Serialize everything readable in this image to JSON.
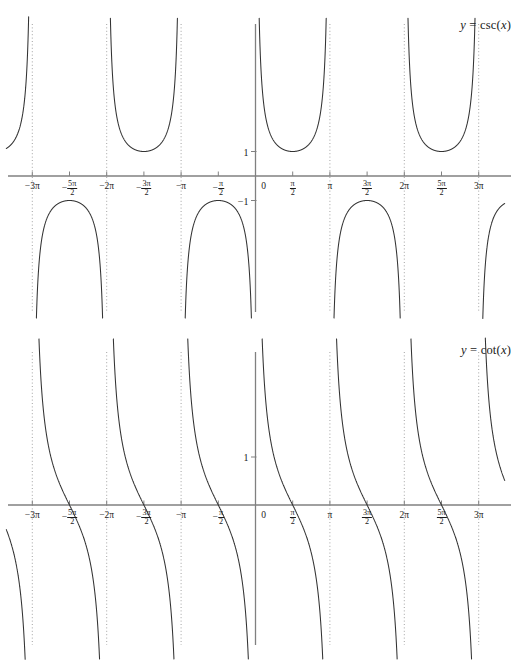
{
  "figure": {
    "panels": [
      {
        "id": "csc",
        "title_prefix": "y",
        "title_eq": " = ",
        "title_fn": "csc(",
        "title_var": "x",
        "title_close": ")",
        "title_full": "y = csc(x)",
        "y_labels": [
          {
            "text": "1",
            "value": 1
          },
          {
            "text": "−1",
            "value": -1
          }
        ]
      },
      {
        "id": "cot",
        "title_prefix": "y",
        "title_eq": " = ",
        "title_fn": "cot(",
        "title_var": "x",
        "title_close": ")",
        "title_full": "y = cot(x)",
        "y_labels": [
          {
            "text": "1",
            "value": 1
          }
        ]
      }
    ],
    "x_tick_labels": [
      {
        "whole": "−3π",
        "num": null,
        "den": null,
        "value": -3
      },
      {
        "whole": null,
        "sign": "−",
        "num": "5π",
        "den": "2",
        "value": -2.5
      },
      {
        "whole": "−2π",
        "num": null,
        "den": null,
        "value": -2
      },
      {
        "whole": null,
        "sign": "−",
        "num": "3π",
        "den": "2",
        "value": -1.5
      },
      {
        "whole": "−π",
        "num": null,
        "den": null,
        "value": -1
      },
      {
        "whole": null,
        "sign": "−",
        "num": "π",
        "den": "2",
        "value": -0.5
      },
      {
        "whole": "0",
        "num": null,
        "den": null,
        "value": 0
      },
      {
        "whole": null,
        "sign": "",
        "num": "π",
        "den": "2",
        "value": 0.5
      },
      {
        "whole": "π",
        "num": null,
        "den": null,
        "value": 1
      },
      {
        "whole": null,
        "sign": "",
        "num": "3π",
        "den": "2",
        "value": 1.5
      },
      {
        "whole": "2π",
        "num": null,
        "den": null,
        "value": 2
      },
      {
        "whole": null,
        "sign": "",
        "num": "5π",
        "den": "2",
        "value": 2.5
      },
      {
        "whole": "3π",
        "num": null,
        "den": null,
        "value": 3
      }
    ]
  },
  "colors": {
    "curve": "#333333",
    "axis": "#808080",
    "asymptote": "#999999",
    "text": "#1a1a1a",
    "background": "#ffffff"
  },
  "chart_data": [
    {
      "type": "line",
      "title": "y = csc(x)",
      "function": "csc(x) = 1/sin(x)",
      "xlabel": "",
      "ylabel": "",
      "xlim": [
        -3.35,
        3.35
      ],
      "xlim_units": "multiples of pi",
      "ylim": [
        -4.1,
        4.1
      ],
      "grid": false,
      "legend": "none",
      "x_ticks_pi": [
        -3,
        -2.5,
        -2,
        -1.5,
        -1,
        -0.5,
        0,
        0.5,
        1,
        1.5,
        2,
        2.5,
        3
      ],
      "x_tick_labels": [
        "−3π",
        "−5π/2",
        "−2π",
        "−3π/2",
        "−π",
        "−π/2",
        "0",
        "π/2",
        "π",
        "3π/2",
        "2π",
        "5π/2",
        "3π"
      ],
      "y_ticks": [
        1,
        -1
      ],
      "y_tick_labels": [
        "1",
        "−1"
      ],
      "asymptotes_pi": [
        -3,
        -2,
        -1,
        0,
        1,
        2,
        3
      ],
      "branch_domains_pi": [
        [
          -3,
          -2
        ],
        [
          -2,
          -1
        ],
        [
          -1,
          0
        ],
        [
          0,
          1
        ],
        [
          1,
          2
        ],
        [
          2,
          3
        ]
      ],
      "local_extrema": [
        {
          "x_pi": -2.5,
          "y": 1
        },
        {
          "x_pi": -1.5,
          "y": -1
        },
        {
          "x_pi": -0.5,
          "y": -1
        },
        {
          "x_pi": 0.5,
          "y": 1
        },
        {
          "x_pi": 1.5,
          "y": -1
        },
        {
          "x_pi": 2.5,
          "y": 1
        }
      ],
      "period_pi": 2,
      "range": "y <= -1 or y >= 1"
    },
    {
      "type": "line",
      "title": "y = cot(x)",
      "function": "cot(x) = cos(x)/sin(x)",
      "xlabel": "",
      "ylabel": "",
      "xlim": [
        -3.35,
        3.35
      ],
      "xlim_units": "multiples of pi",
      "ylim": [
        -4.1,
        4.1
      ],
      "grid": false,
      "legend": "none",
      "x_ticks_pi": [
        -3,
        -2.5,
        -2,
        -1.5,
        -1,
        -0.5,
        0,
        0.5,
        1,
        1.5,
        2,
        2.5,
        3
      ],
      "x_tick_labels": [
        "−3π",
        "−5π/2",
        "−2π",
        "−3π/2",
        "−π",
        "−π/2",
        "0",
        "π/2",
        "π",
        "3π/2",
        "2π",
        "5π/2",
        "3π"
      ],
      "y_ticks": [
        1
      ],
      "y_tick_labels": [
        "1"
      ],
      "asymptotes_pi": [
        -3,
        -2,
        -1,
        0,
        1,
        2,
        3
      ],
      "branch_domains_pi": [
        [
          -3,
          -2
        ],
        [
          -2,
          -1
        ],
        [
          -1,
          0
        ],
        [
          0,
          1
        ],
        [
          1,
          2
        ],
        [
          2,
          3
        ]
      ],
      "zeros_pi": [
        -2.5,
        -1.5,
        -0.5,
        0.5,
        1.5,
        2.5
      ],
      "period_pi": 1,
      "range": "all real numbers",
      "monotonic": "decreasing on each branch"
    }
  ]
}
